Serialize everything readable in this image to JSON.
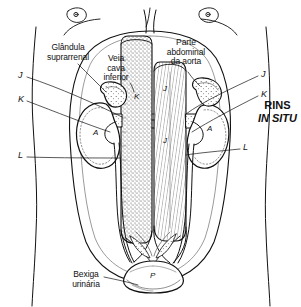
{
  "figure": {
    "title_line1": "RINS",
    "title_line2": "IN SITU",
    "labels": {
      "adrenal": "Glândula\nsuprarrenal",
      "vena_cava": "Veia\ncava\ninferior",
      "aorta": "Parte\nabdominal\nda aorta",
      "bladder": "Bexiga\nurinária"
    },
    "margin_keys": {
      "left_j": "J",
      "left_k": "K",
      "left_l": "L",
      "right_j": "J",
      "right_k": "K",
      "right_l": "L"
    },
    "internal_keys": {
      "kidney_left": "A",
      "kidney_right": "A",
      "vena_cava": "K",
      "aorta_upper": "J",
      "aorta_lower": "J",
      "bladder": "P"
    },
    "colors": {
      "ink": "#111111",
      "paper": "#ffffff"
    }
  }
}
